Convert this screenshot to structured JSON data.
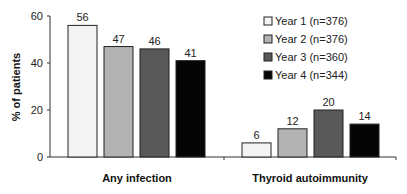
{
  "chart_data": {
    "type": "bar",
    "title": "",
    "xlabel": "",
    "ylabel": "% of patients",
    "ylim": [
      0,
      60
    ],
    "yticks": [
      0,
      20,
      40,
      60
    ],
    "grid": false,
    "legend_position": "top-right",
    "categories": [
      "Any infection",
      "Thyroid autoimmunity"
    ],
    "series": [
      {
        "name": "Year 1 (n=376)",
        "color": "#f4f4f4",
        "values": [
          56,
          6
        ]
      },
      {
        "name": "Year 2 (n=376)",
        "color": "#b3b3b3",
        "values": [
          47,
          12
        ]
      },
      {
        "name": "Year 3  (n=360)",
        "color": "#595959",
        "values": [
          46,
          20
        ]
      },
      {
        "name": "Year 4 (n=344)",
        "color": "#050505",
        "values": [
          41,
          14
        ]
      }
    ]
  }
}
